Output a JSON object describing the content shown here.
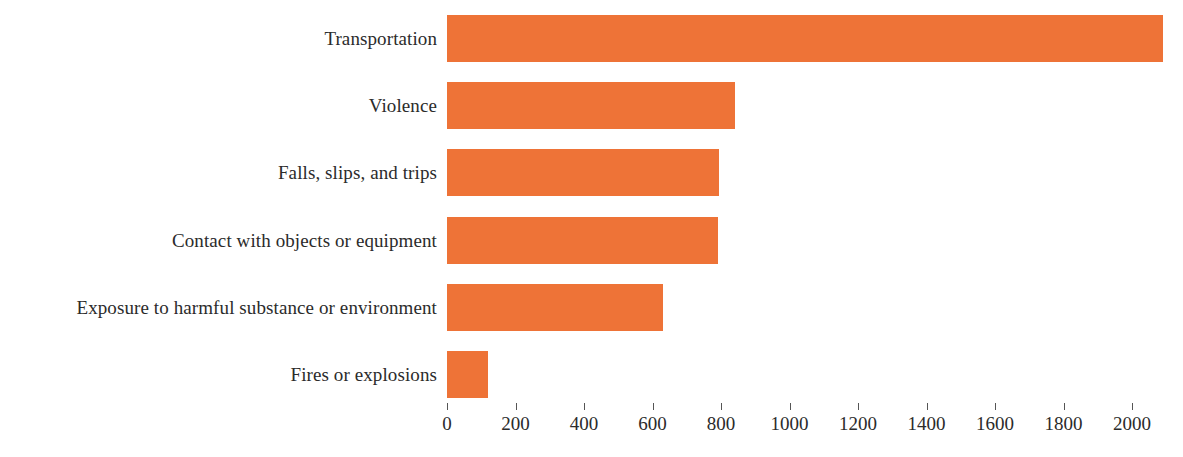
{
  "chart_data": {
    "type": "bar",
    "orientation": "horizontal",
    "title": "",
    "subtitle": "",
    "xlabel": "",
    "ylabel": "",
    "categories": [
      "Transportation",
      "Violence",
      "Falls, slips, and trips",
      "Contact with objects or equipment",
      "Exposure to harmful substance or environment",
      "Fires or explosions"
    ],
    "values": [
      2090,
      840,
      795,
      790,
      630,
      120
    ],
    "xlim": [
      0,
      2100
    ],
    "xticks": [
      0,
      200,
      400,
      600,
      800,
      1000,
      1200,
      1400,
      1600,
      1800,
      2000
    ],
    "xtick_labels": [
      "0",
      "200",
      "400",
      "600",
      "800",
      "1000",
      "1200",
      "1400",
      "1600",
      "1800",
      "2000"
    ],
    "grid": false,
    "legend": false,
    "bar_color": "#ee7337",
    "text_color": "#2b2b2b",
    "background": "#ffffff"
  },
  "layout": {
    "axis_origin_x": 447,
    "pixels_per_unit": 0.3425,
    "bar_height": 47,
    "row_pitch": 67.2,
    "first_row_top": 15
  }
}
